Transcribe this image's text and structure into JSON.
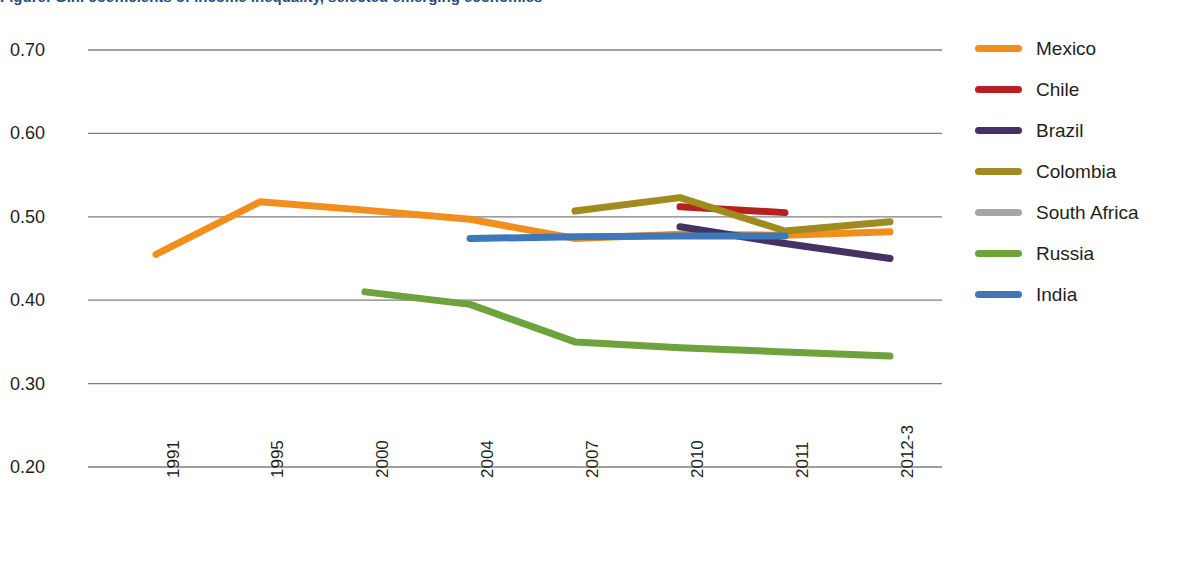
{
  "chart_data": {
    "type": "line",
    "title": "Figure: Gini coefficients of income inequality, selected emerging economies",
    "xlabel": "",
    "ylabel": "",
    "categories": [
      "1991",
      "1995",
      "2000",
      "2004",
      "2007",
      "2010",
      "2011",
      "2012-3"
    ],
    "ylim": [
      0.2,
      0.7
    ],
    "y_ticks": [
      "0.20",
      "0.30",
      "0.40",
      "0.50",
      "0.60",
      "0.70"
    ],
    "grid": true,
    "legend_position": "right",
    "series": [
      {
        "name": "Mexico",
        "color": "#F28E1C",
        "values": [
          0.455,
          0.518,
          0.508,
          0.497,
          0.474,
          0.479,
          0.478,
          0.482
        ]
      },
      {
        "name": "Chile",
        "color": "#B82020",
        "values": [
          null,
          null,
          null,
          null,
          null,
          0.512,
          0.505,
          null
        ]
      },
      {
        "name": "Brazil",
        "color": "#453264",
        "values": [
          null,
          null,
          null,
          null,
          null,
          0.488,
          0.468,
          0.45
        ]
      },
      {
        "name": "Colombia",
        "color": "#A08C1E",
        "values": [
          null,
          null,
          null,
          null,
          0.507,
          0.523,
          0.483,
          0.494
        ]
      },
      {
        "name": "South Africa",
        "color": "#A6A6A6",
        "values": [
          null,
          null,
          null,
          null,
          null,
          0.598,
          null,
          0.575
        ]
      },
      {
        "name": "Russia",
        "color": "#6DA23C",
        "values": [
          null,
          null,
          0.41,
          0.395,
          0.35,
          0.343,
          0.338,
          0.333
        ]
      },
      {
        "name": "India",
        "color": "#3E78B8",
        "values": [
          null,
          null,
          null,
          0.474,
          0.476,
          0.477,
          0.477,
          null
        ]
      }
    ]
  },
  "legend": {
    "items": [
      {
        "label": "Mexico",
        "color": "#F28E1C"
      },
      {
        "label": "Chile",
        "color": "#B82020"
      },
      {
        "label": "Brazil",
        "color": "#453264"
      },
      {
        "label": "Colombia",
        "color": "#A08C1E"
      },
      {
        "label": "South Africa",
        "color": "#A6A6A6"
      },
      {
        "label": "Russia",
        "color": "#6DA23C"
      },
      {
        "label": "India",
        "color": "#3E78B8"
      }
    ]
  },
  "axis": {
    "y_labels": [
      "0.70",
      "0.60",
      "0.50",
      "0.40",
      "0.30",
      "0.20"
    ],
    "x_labels": [
      "1991",
      "1995",
      "2000",
      "2004",
      "2007",
      "2010",
      "2011",
      "2012-3"
    ]
  }
}
